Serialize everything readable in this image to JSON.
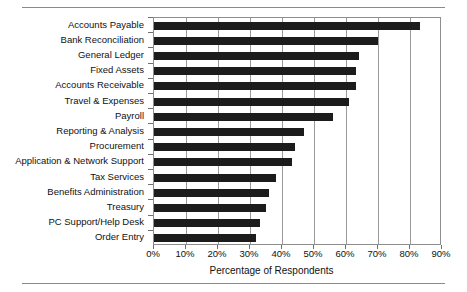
{
  "figure": {
    "has_top_rule": true,
    "has_bottom_rule": true,
    "rule_color": "#8a8a8a",
    "bar_color": "#1c1c1c",
    "grid_color": "#9a9a9a",
    "frame_color": "#8e8e8e",
    "background": "#ffffff"
  },
  "chart_data": {
    "type": "bar",
    "orientation": "horizontal",
    "title": "",
    "xlabel": "Percentage of Respondents",
    "ylabel": "",
    "xlim": [
      0,
      90
    ],
    "ylim": null,
    "grid": true,
    "grid_axis": "x",
    "legend": null,
    "legend_position": "none",
    "xticks": [
      0,
      10,
      20,
      30,
      40,
      50,
      60,
      70,
      80,
      90
    ],
    "xtick_labels": [
      "0%",
      "10%",
      "20%",
      "30%",
      "40%",
      "50%",
      "60%",
      "70%",
      "80%",
      "90%"
    ],
    "categories": [
      "Accounts Payable",
      "Bank Reconciliation",
      "General Ledger",
      "Fixed Assets",
      "Accounts Receivable",
      "Travel & Expenses",
      "Payroll",
      "Reporting & Analysis",
      "Procurement",
      "Application & Network Support",
      "Tax Services",
      "Benefits Administration",
      "Treasury",
      "PC Support/Help Desk",
      "Order Entry"
    ],
    "values": [
      83,
      70,
      64,
      63,
      63,
      61,
      56,
      47,
      44,
      43,
      38,
      36,
      35,
      33,
      32
    ],
    "series": [
      {
        "name": "Percentage of Respondents",
        "values": [
          83,
          70,
          64,
          63,
          63,
          61,
          56,
          47,
          44,
          43,
          38,
          36,
          35,
          33,
          32
        ]
      }
    ]
  }
}
